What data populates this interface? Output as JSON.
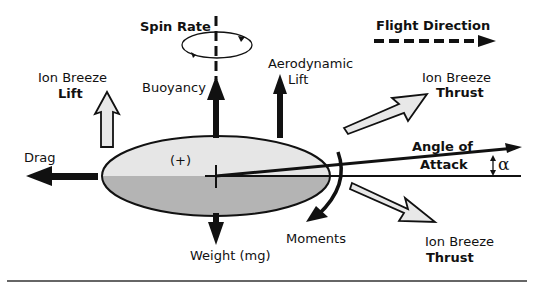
{
  "diagram": {
    "labels": {
      "spin_rate": "Spin Rate",
      "flight_direction": "Flight Direction",
      "ion_breeze_lift_1": "Ion Breeze",
      "ion_breeze_lift_2": "Lift",
      "buoyancy": "Buoyancy",
      "aero_lift_1": "Aerodynamic",
      "aero_lift_2": "Lift",
      "ion_breeze_thrust_top_1": "Ion Breeze",
      "ion_breeze_thrust_top_2": "Thrust",
      "angle_of_attack_1": "Angle of",
      "angle_of_attack_2": "Attack",
      "alpha": "α",
      "drag": "Drag",
      "charge": "(+)",
      "moments": "Moments",
      "weight": "Weight (mg)",
      "ion_breeze_thrust_bottom_1": "Ion Breeze",
      "ion_breeze_thrust_bottom_2": "Thrust"
    },
    "colors": {
      "ink": "#111111",
      "body_top": "#e6e6e6",
      "body_bottom": "#b4b4b4",
      "hollow_arrow_fill": "#e8e8e8",
      "rule": "#333333"
    }
  }
}
